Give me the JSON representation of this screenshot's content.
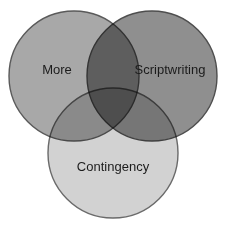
{
  "diagram": {
    "type": "venn",
    "set_count": 3,
    "background_color": "#ffffff",
    "label_color": "#1c1c1c",
    "outline_color": "#555555",
    "canvas": {
      "width": 226,
      "height": 230
    },
    "sets": [
      {
        "id": "more",
        "label": "More",
        "fill_color": "#a8a8a8",
        "outline_color": "#5a5a5a",
        "cx": 74,
        "cy": 76,
        "r": 65,
        "label_x": 57,
        "label_y": 71
      },
      {
        "id": "scriptwriting",
        "label": "Scriptwriting",
        "fill_color": "#8f8f8f",
        "outline_color": "#4e4e4e",
        "cx": 152,
        "cy": 76,
        "r": 65,
        "label_x": 170,
        "label_y": 71
      },
      {
        "id": "contingency",
        "label": "Contingency",
        "fill_color": "#d2d2d2",
        "outline_color": "#6a6a6a",
        "cx": 113,
        "cy": 153,
        "r": 65,
        "label_x": 113,
        "label_y": 168
      }
    ],
    "intersections": [
      {
        "id": "more-scriptwriting",
        "sets": [
          "more",
          "scriptwriting"
        ],
        "label": ""
      },
      {
        "id": "more-contingency",
        "sets": [
          "more",
          "contingency"
        ],
        "label": ""
      },
      {
        "id": "scriptwriting-contingency",
        "sets": [
          "scriptwriting",
          "contingency"
        ],
        "label": ""
      },
      {
        "id": "more-scriptwriting-contingency",
        "sets": [
          "more",
          "scriptwriting",
          "contingency"
        ],
        "label": ""
      }
    ]
  }
}
